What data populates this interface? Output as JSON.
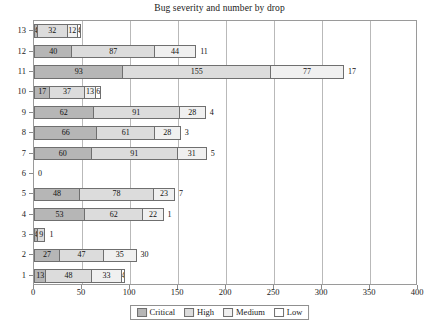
{
  "chart_data": {
    "type": "bar",
    "title": "Bug severity and number by drop",
    "xlabel": "",
    "ylabel": "",
    "orientation": "horizontal",
    "stacked": true,
    "grid": true,
    "legend_position": "bottom",
    "xlim": [
      0,
      400
    ],
    "xticks": [
      0,
      50,
      100,
      150,
      200,
      250,
      300,
      350,
      400
    ],
    "xtick_labels": [
      "0",
      "50",
      "100",
      "150",
      "200",
      "250",
      "300",
      "350",
      "400"
    ],
    "categories": [
      "1",
      "2",
      "3",
      "4",
      "5",
      "6",
      "7",
      "8",
      "9",
      "10",
      "11",
      "12",
      "13"
    ],
    "series": [
      {
        "name": "Critical",
        "color": "#b6b6b6",
        "values": [
          13,
          27,
          4,
          53,
          48,
          0,
          60,
          66,
          62,
          17,
          93,
          40,
          4
        ]
      },
      {
        "name": "High",
        "color": "#dcdcdc",
        "values": [
          48,
          47,
          9,
          62,
          78,
          0,
          91,
          61,
          91,
          37,
          155,
          87,
          32
        ]
      },
      {
        "name": "Medium",
        "color": "#f0f0f0",
        "values": [
          33,
          35,
          1,
          22,
          23,
          0,
          31,
          28,
          28,
          13,
          77,
          44,
          12
        ]
      },
      {
        "name": "Low",
        "color": "#ffffff",
        "values": [
          4,
          30,
          0,
          1,
          7,
          0,
          5,
          3,
          4,
          6,
          17,
          11,
          4
        ]
      }
    ],
    "rows": [
      {
        "category": "13",
        "segments": [
          {
            "series": "Critical",
            "value": 4,
            "label": "4"
          },
          {
            "series": "High",
            "value": 32,
            "label": "32"
          },
          {
            "series": "Medium",
            "value": 12,
            "label": "12"
          },
          {
            "series": "Low",
            "value": 4,
            "label": "4"
          }
        ],
        "outside_label": ""
      },
      {
        "category": "12",
        "segments": [
          {
            "series": "Critical",
            "value": 40,
            "label": "40"
          },
          {
            "series": "High",
            "value": 87,
            "label": "87"
          },
          {
            "series": "Medium",
            "value": 44,
            "label": "44"
          }
        ],
        "outside_label": "11"
      },
      {
        "category": "11",
        "segments": [
          {
            "series": "Critical",
            "value": 93,
            "label": "93"
          },
          {
            "series": "High",
            "value": 155,
            "label": "155"
          },
          {
            "series": "Medium",
            "value": 77,
            "label": "77"
          }
        ],
        "outside_label": "17"
      },
      {
        "category": "10",
        "segments": [
          {
            "series": "Critical",
            "value": 17,
            "label": "17"
          },
          {
            "series": "High",
            "value": 37,
            "label": "37"
          },
          {
            "series": "Medium",
            "value": 13,
            "label": "13"
          },
          {
            "series": "Low",
            "value": 6,
            "label": "6"
          }
        ],
        "outside_label": ""
      },
      {
        "category": "9",
        "segments": [
          {
            "series": "Critical",
            "value": 62,
            "label": "62"
          },
          {
            "series": "High",
            "value": 91,
            "label": "91"
          },
          {
            "series": "Medium",
            "value": 28,
            "label": "28"
          }
        ],
        "outside_label": "4"
      },
      {
        "category": "8",
        "segments": [
          {
            "series": "Critical",
            "value": 66,
            "label": "66"
          },
          {
            "series": "High",
            "value": 61,
            "label": "61"
          },
          {
            "series": "Medium",
            "value": 28,
            "label": "28"
          }
        ],
        "outside_label": "3"
      },
      {
        "category": "7",
        "segments": [
          {
            "series": "Critical",
            "value": 60,
            "label": "60"
          },
          {
            "series": "High",
            "value": 91,
            "label": "91"
          },
          {
            "series": "Medium",
            "value": 31,
            "label": "31"
          }
        ],
        "outside_label": "5"
      },
      {
        "category": "6",
        "segments": [],
        "outside_label": "0"
      },
      {
        "category": "5",
        "segments": [
          {
            "series": "Critical",
            "value": 48,
            "label": "48"
          },
          {
            "series": "High",
            "value": 78,
            "label": "78"
          },
          {
            "series": "Medium",
            "value": 23,
            "label": "23"
          }
        ],
        "outside_label": "7"
      },
      {
        "category": "4",
        "segments": [
          {
            "series": "Critical",
            "value": 53,
            "label": "53"
          },
          {
            "series": "High",
            "value": 62,
            "label": "62"
          },
          {
            "series": "Medium",
            "value": 22,
            "label": "22"
          }
        ],
        "outside_label": "1"
      },
      {
        "category": "3",
        "segments": [
          {
            "series": "Critical",
            "value": 4,
            "label": "4"
          },
          {
            "series": "High",
            "value": 9,
            "label": "9"
          }
        ],
        "outside_label": "1"
      },
      {
        "category": "2",
        "segments": [
          {
            "series": "Critical",
            "value": 27,
            "label": "27"
          },
          {
            "series": "High",
            "value": 47,
            "label": "47"
          },
          {
            "series": "Medium",
            "value": 35,
            "label": "35"
          }
        ],
        "outside_label": "30"
      },
      {
        "category": "1",
        "segments": [
          {
            "series": "Critical",
            "value": 13,
            "label": "13"
          },
          {
            "series": "High",
            "value": 48,
            "label": "48"
          },
          {
            "series": "Medium",
            "value": 33,
            "label": "33"
          },
          {
            "series": "Low",
            "value": 4,
            "label": "4"
          }
        ],
        "outside_label": ""
      }
    ],
    "legend": [
      {
        "label": "Critical",
        "color": "#b6b6b6"
      },
      {
        "label": "High",
        "color": "#dcdcdc"
      },
      {
        "label": "Medium",
        "color": "#f0f0f0"
      },
      {
        "label": "Low",
        "color": "#ffffff"
      }
    ]
  }
}
